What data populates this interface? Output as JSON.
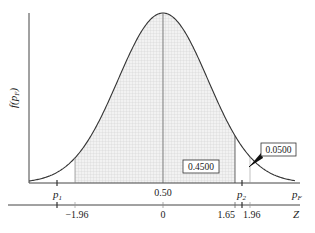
{
  "chart_data": {
    "type": "area",
    "title": "",
    "ylabel": "f(p_F)",
    "xlabel": "p_F",
    "secondary_xlabel": "Z",
    "grid": false,
    "legend": null,
    "pF_axis_ticks": [
      {
        "label": "p_1",
        "position": "p1"
      },
      {
        "label": "0.50",
        "position": "center"
      },
      {
        "label": "p_2",
        "position": "p2"
      }
    ],
    "z_axis_ticks": [
      -1.96,
      0,
      1.65,
      1.96
    ],
    "annotations": [
      {
        "text": "0.4500",
        "region": "area between mean (Z=0) and Z=1.65"
      },
      {
        "text": "0.0500",
        "region": "upper tail beyond Z=1.65 (arrow to tail)"
      }
    ],
    "vertical_lines_Z": [
      -1.96,
      0,
      1.65,
      1.96
    ],
    "shaded_region_Z": [
      -1.96,
      1.65
    ],
    "curve": {
      "mean": 0,
      "sd": 1,
      "xrange_Z": [
        -2.8,
        3.2
      ]
    }
  },
  "labels": {
    "ylabel_main": "f(p",
    "ylabel_sub": "F",
    "ylabel_close": ")",
    "p1_main": "p",
    "p1_sub": "1",
    "center": "0.50",
    "p2_main": "p",
    "p2_sub": "2",
    "pF_main": "p",
    "pF_sub": "F",
    "z_neg196": "−1.96",
    "z_0": "0",
    "z_165": "1.65",
    "z_196": "1.96",
    "z_axis": "Z",
    "box_center": "0.4500",
    "box_tail": "0.0500"
  },
  "colors": {
    "line": "#333333",
    "shade": "#e6e6e6",
    "hatch": "#cfcfcf"
  }
}
